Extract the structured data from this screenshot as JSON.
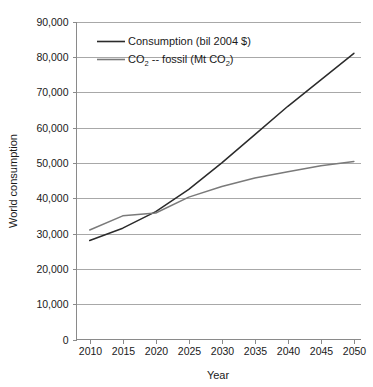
{
  "chart_data": {
    "type": "line",
    "title": "",
    "xlabel": "Year",
    "ylabel": "World consumption",
    "x": [
      2010,
      2015,
      2020,
      2025,
      2030,
      2035,
      2040,
      2045,
      2050
    ],
    "xlim": [
      2008,
      2051
    ],
    "ylim": [
      0,
      90000
    ],
    "xticks": [
      "2010",
      "2015",
      "2020",
      "2025",
      "2030",
      "2035",
      "2040",
      "2045",
      "2050"
    ],
    "yticks": [
      "0",
      "10,000",
      "20,000",
      "30,000",
      "40,000",
      "50,000",
      "60,000",
      "70,000",
      "80,000",
      "90,000"
    ],
    "ytick_values": [
      0,
      10000,
      20000,
      30000,
      40000,
      50000,
      60000,
      70000,
      80000,
      90000
    ],
    "grid": true,
    "legend_position": "top-left-inside",
    "series": [
      {
        "name": "Consumption (bil 2004 $)",
        "name_parts": {
          "pre": "Consumption (bil 2004 $)",
          "sub": "",
          "post": ""
        },
        "color": "#2b2b2b",
        "values": [
          28000,
          31500,
          36200,
          42500,
          50000,
          58000,
          66000,
          73500,
          81000
        ]
      },
      {
        "name": "CO2 -- fossil (Mt CO2)",
        "color": "#7a7a7a",
        "values": [
          31000,
          35000,
          35800,
          40300,
          43300,
          45700,
          47500,
          49200,
          50400
        ]
      }
    ],
    "legend": [
      {
        "id": "legend-consumption",
        "color": "#2b2b2b",
        "pre": "Consumption (bil 2004 $)",
        "sub1": "",
        "mid": "",
        "sub2": "",
        "post": ""
      },
      {
        "id": "legend-co2",
        "color": "#7a7a7a",
        "pre": "CO",
        "sub1": "2",
        "mid": " -- fossil (Mt CO",
        "sub2": "2",
        "post": ")"
      }
    ]
  },
  "colors": {
    "background": "#ffffff",
    "grid": "#a8a8a8",
    "axis": "#8a8a8a",
    "text": "#1a1a1a",
    "series_consumption": "#2b2b2b",
    "series_co2": "#7a7a7a"
  }
}
